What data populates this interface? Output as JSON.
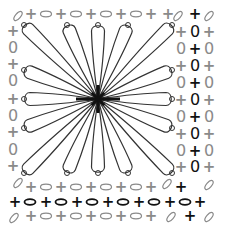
{
  "diagram": {
    "type": "crochet-chart",
    "center": [
      98,
      99
    ],
    "colors": {
      "dark": "#111111",
      "gray": "#8a8a8a",
      "petal": "#333333",
      "background": "#ffffff"
    },
    "petals": [
      {
        "tip": [
          24,
          25
        ]
      },
      {
        "tip": [
          67,
          25
        ]
      },
      {
        "tip": [
          98,
          25
        ]
      },
      {
        "tip": [
          128,
          25
        ]
      },
      {
        "tip": [
          172,
          25
        ]
      },
      {
        "tip": [
          24,
          70
        ]
      },
      {
        "tip": [
          24,
          99
        ]
      },
      {
        "tip": [
          24,
          128
        ]
      },
      {
        "tip": [
          172,
          70
        ]
      },
      {
        "tip": [
          172,
          99
        ]
      },
      {
        "tip": [
          172,
          128
        ]
      },
      {
        "tip": [
          24,
          173
        ]
      },
      {
        "tip": [
          67,
          173
        ]
      },
      {
        "tip": [
          98,
          173
        ]
      },
      {
        "tip": [
          128,
          173
        ]
      },
      {
        "tip": [
          172,
          173
        ]
      }
    ],
    "symbols": [
      {
        "t": "+",
        "x": 31,
        "y": 14,
        "c": "gray"
      },
      {
        "t": "oval",
        "x": 46,
        "y": 14,
        "c": "gray"
      },
      {
        "t": "+",
        "x": 61,
        "y": 14,
        "c": "gray"
      },
      {
        "t": "oval",
        "x": 76,
        "y": 14,
        "c": "gray"
      },
      {
        "t": "+",
        "x": 91,
        "y": 14,
        "c": "gray"
      },
      {
        "t": "oval",
        "x": 106,
        "y": 14,
        "c": "gray"
      },
      {
        "t": "+",
        "x": 121,
        "y": 14,
        "c": "gray"
      },
      {
        "t": "oval",
        "x": 136,
        "y": 14,
        "c": "gray"
      },
      {
        "t": "+",
        "x": 151,
        "y": 14,
        "c": "gray"
      },
      {
        "t": "+",
        "x": 168,
        "y": 14,
        "c": "gray"
      },
      {
        "t": "slant",
        "x": 18,
        "y": 16,
        "c": "gray"
      },
      {
        "t": "slant",
        "x": 178,
        "y": 16,
        "c": "gray"
      },
      {
        "t": "+",
        "x": 195,
        "y": 14,
        "c": "dark"
      },
      {
        "t": "slant",
        "x": 209,
        "y": 16,
        "c": "gray"
      },
      {
        "t": "+",
        "x": 13,
        "y": 31,
        "c": "gray"
      },
      {
        "t": "0",
        "x": 13,
        "y": 48,
        "c": "gray"
      },
      {
        "t": "+",
        "x": 13,
        "y": 64,
        "c": "gray"
      },
      {
        "t": "0",
        "x": 13,
        "y": 81,
        "c": "gray"
      },
      {
        "t": "+",
        "x": 13,
        "y": 99,
        "c": "gray"
      },
      {
        "t": "0",
        "x": 13,
        "y": 116,
        "c": "gray"
      },
      {
        "t": "+",
        "x": 13,
        "y": 132,
        "c": "gray"
      },
      {
        "t": "0",
        "x": 13,
        "y": 150,
        "c": "gray"
      },
      {
        "t": "+",
        "x": 13,
        "y": 166,
        "c": "gray"
      },
      {
        "t": "+",
        "x": 181,
        "y": 32,
        "c": "gray"
      },
      {
        "t": "0",
        "x": 195,
        "y": 32,
        "c": "dark"
      },
      {
        "t": "+",
        "x": 209,
        "y": 32,
        "c": "gray"
      },
      {
        "t": "0",
        "x": 181,
        "y": 49,
        "c": "gray"
      },
      {
        "t": "+",
        "x": 195,
        "y": 49,
        "c": "dark"
      },
      {
        "t": "0",
        "x": 209,
        "y": 49,
        "c": "gray"
      },
      {
        "t": "+",
        "x": 181,
        "y": 66,
        "c": "gray"
      },
      {
        "t": "0",
        "x": 195,
        "y": 66,
        "c": "dark"
      },
      {
        "t": "+",
        "x": 209,
        "y": 66,
        "c": "gray"
      },
      {
        "t": "0",
        "x": 181,
        "y": 83,
        "c": "gray"
      },
      {
        "t": "+",
        "x": 195,
        "y": 83,
        "c": "dark"
      },
      {
        "t": "0",
        "x": 209,
        "y": 83,
        "c": "gray"
      },
      {
        "t": "+",
        "x": 181,
        "y": 100,
        "c": "gray"
      },
      {
        "t": "0",
        "x": 195,
        "y": 100,
        "c": "dark"
      },
      {
        "t": "+",
        "x": 209,
        "y": 100,
        "c": "gray"
      },
      {
        "t": "0",
        "x": 181,
        "y": 117,
        "c": "gray"
      },
      {
        "t": "+",
        "x": 195,
        "y": 117,
        "c": "dark"
      },
      {
        "t": "0",
        "x": 209,
        "y": 117,
        "c": "gray"
      },
      {
        "t": "+",
        "x": 181,
        "y": 134,
        "c": "gray"
      },
      {
        "t": "0",
        "x": 195,
        "y": 134,
        "c": "dark"
      },
      {
        "t": "+",
        "x": 209,
        "y": 134,
        "c": "gray"
      },
      {
        "t": "0",
        "x": 181,
        "y": 151,
        "c": "gray"
      },
      {
        "t": "+",
        "x": 195,
        "y": 151,
        "c": "dark"
      },
      {
        "t": "0",
        "x": 209,
        "y": 151,
        "c": "gray"
      },
      {
        "t": "+",
        "x": 181,
        "y": 167,
        "c": "gray"
      },
      {
        "t": "0",
        "x": 195,
        "y": 167,
        "c": "dark"
      },
      {
        "t": "+",
        "x": 209,
        "y": 167,
        "c": "gray"
      },
      {
        "t": "slant",
        "x": 18,
        "y": 183,
        "c": "gray"
      },
      {
        "t": "+",
        "x": 31,
        "y": 187,
        "c": "gray"
      },
      {
        "t": "oval",
        "x": 46,
        "y": 187,
        "c": "gray"
      },
      {
        "t": "+",
        "x": 61,
        "y": 187,
        "c": "gray"
      },
      {
        "t": "oval",
        "x": 76,
        "y": 187,
        "c": "gray"
      },
      {
        "t": "+",
        "x": 91,
        "y": 187,
        "c": "gray"
      },
      {
        "t": "oval",
        "x": 106,
        "y": 187,
        "c": "gray"
      },
      {
        "t": "+",
        "x": 121,
        "y": 187,
        "c": "gray"
      },
      {
        "t": "oval",
        "x": 136,
        "y": 187,
        "c": "gray"
      },
      {
        "t": "+",
        "x": 151,
        "y": 187,
        "c": "gray"
      },
      {
        "t": "slant",
        "x": 167,
        "y": 184,
        "c": "gray"
      },
      {
        "t": "+",
        "x": 181,
        "y": 187,
        "c": "dark"
      },
      {
        "t": "slant",
        "x": 209,
        "y": 185,
        "c": "gray"
      },
      {
        "t": "+",
        "x": 15,
        "y": 202,
        "c": "dark"
      },
      {
        "t": "oval",
        "x": 30,
        "y": 202,
        "c": "dark"
      },
      {
        "t": "+",
        "x": 46,
        "y": 202,
        "c": "dark"
      },
      {
        "t": "oval",
        "x": 61,
        "y": 202,
        "c": "dark"
      },
      {
        "t": "+",
        "x": 77,
        "y": 202,
        "c": "dark"
      },
      {
        "t": "oval",
        "x": 92,
        "y": 202,
        "c": "dark"
      },
      {
        "t": "+",
        "x": 108,
        "y": 202,
        "c": "dark"
      },
      {
        "t": "oval",
        "x": 123,
        "y": 202,
        "c": "dark"
      },
      {
        "t": "+",
        "x": 139,
        "y": 202,
        "c": "dark"
      },
      {
        "t": "oval",
        "x": 154,
        "y": 202,
        "c": "dark"
      },
      {
        "t": "+",
        "x": 170,
        "y": 202,
        "c": "dark"
      },
      {
        "t": "oval",
        "x": 185,
        "y": 202,
        "c": "dark"
      },
      {
        "t": "+",
        "x": 200,
        "y": 202,
        "c": "dark"
      },
      {
        "t": "slant",
        "x": 14,
        "y": 218,
        "c": "gray"
      },
      {
        "t": "+",
        "x": 31,
        "y": 216,
        "c": "gray"
      },
      {
        "t": "oval",
        "x": 46,
        "y": 216,
        "c": "gray"
      },
      {
        "t": "+",
        "x": 61,
        "y": 216,
        "c": "gray"
      },
      {
        "t": "oval",
        "x": 76,
        "y": 216,
        "c": "gray"
      },
      {
        "t": "+",
        "x": 91,
        "y": 216,
        "c": "gray"
      },
      {
        "t": "oval",
        "x": 106,
        "y": 216,
        "c": "gray"
      },
      {
        "t": "+",
        "x": 121,
        "y": 216,
        "c": "gray"
      },
      {
        "t": "oval",
        "x": 136,
        "y": 216,
        "c": "gray"
      },
      {
        "t": "+",
        "x": 151,
        "y": 216,
        "c": "gray"
      },
      {
        "t": "slant",
        "x": 171,
        "y": 217,
        "c": "gray"
      },
      {
        "t": "+",
        "x": 190,
        "y": 216,
        "c": "dark"
      },
      {
        "t": "slant",
        "x": 209,
        "y": 217,
        "c": "gray"
      }
    ]
  }
}
